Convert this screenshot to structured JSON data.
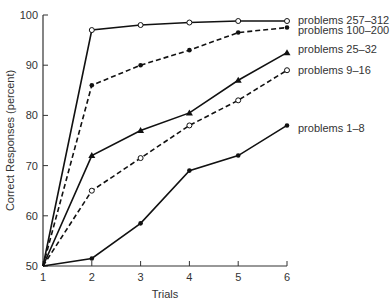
{
  "chart_data": {
    "type": "line",
    "title": "",
    "xlabel": "Trials",
    "ylabel": "Correct Responses (percent)",
    "x": [
      1,
      2,
      3,
      4,
      5,
      6
    ],
    "xlim": [
      1,
      6
    ],
    "ylim": [
      50,
      100
    ],
    "yticks": [
      50,
      60,
      70,
      80,
      90,
      100
    ],
    "xticks": [
      1,
      2,
      3,
      4,
      5,
      6
    ],
    "grid": false,
    "legend_position": "right, inline labels at series ends",
    "series": [
      {
        "name": "problems 257–312",
        "values": [
          50,
          97,
          98,
          98.5,
          98.8,
          98.8
        ],
        "line": "solid",
        "marker": "open-circle"
      },
      {
        "name": "problems 100–200",
        "values": [
          50,
          86,
          90,
          93,
          96.5,
          97.5
        ],
        "line": "dashed",
        "marker": "filled-circle"
      },
      {
        "name": "problems 25–32",
        "values": [
          50,
          72,
          77,
          80.5,
          87,
          92.5
        ],
        "line": "solid",
        "marker": "filled-triangle"
      },
      {
        "name": "problems 9–16",
        "values": [
          50,
          65,
          71.5,
          78,
          83,
          89
        ],
        "line": "dashed",
        "marker": "open-circle"
      },
      {
        "name": "problems 1–8",
        "values": [
          50,
          51.5,
          58.5,
          69,
          72,
          78
        ],
        "line": "solid",
        "marker": "filled-circle"
      }
    ]
  },
  "colors": {
    "line": "#111111",
    "axis": "#333333",
    "background": "#ffffff"
  }
}
